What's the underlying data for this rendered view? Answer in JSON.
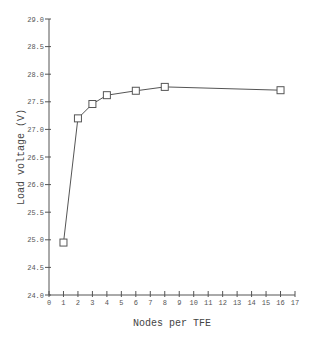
{
  "chart_data": {
    "type": "line",
    "title": "",
    "xlabel": "Nodes per TFE",
    "ylabel": "Load voltage (V)",
    "xlim": [
      0,
      17
    ],
    "ylim": [
      24.0,
      29.0
    ],
    "x_ticks": [
      0,
      1,
      2,
      3,
      4,
      5,
      6,
      7,
      8,
      9,
      10,
      11,
      12,
      13,
      14,
      15,
      16,
      17
    ],
    "y_ticks": [
      "24.0",
      "24.5",
      "25.0",
      "25.5",
      "26.0",
      "26.5",
      "27.0",
      "27.5",
      "28.0",
      "28.5",
      "29.0"
    ],
    "grid": false,
    "legend": null,
    "marker": "square",
    "series": [
      {
        "name": "Load voltage",
        "x": [
          1,
          2,
          3,
          4,
          6,
          8,
          16
        ],
        "values": [
          24.95,
          27.2,
          27.46,
          27.62,
          27.7,
          27.77,
          27.71
        ]
      }
    ],
    "colors": {
      "line": "#555555",
      "axis": "#555555",
      "text": "#444444"
    }
  }
}
